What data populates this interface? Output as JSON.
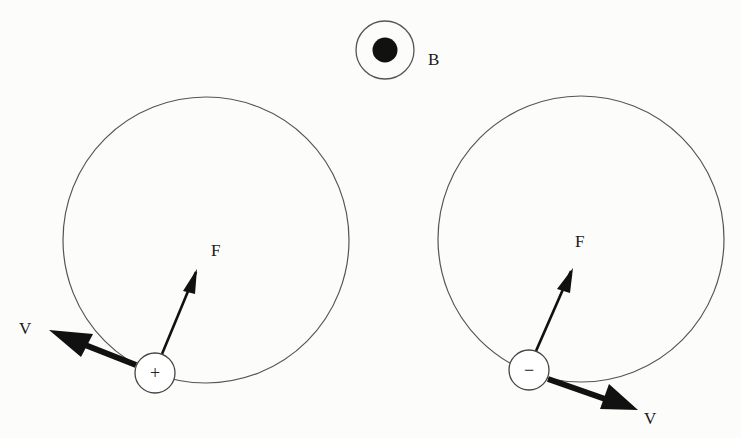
{
  "figure": {
    "colors": {
      "background": "#fcfcfa",
      "ink": "#111111",
      "orbit_stroke": "#555555"
    },
    "magnetic_field": {
      "label": "B",
      "symbol": "dot-in-circle",
      "meaning": "out-of-page"
    },
    "particles": [
      {
        "id": "positive",
        "charge_sign": "+",
        "velocity_label": "V",
        "force_label": "F",
        "orbit": "left"
      },
      {
        "id": "negative",
        "charge_sign": "−",
        "velocity_label": "V",
        "force_label": "F",
        "orbit": "right"
      }
    ]
  }
}
